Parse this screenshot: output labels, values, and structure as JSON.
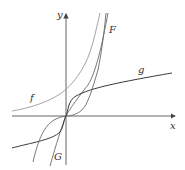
{
  "diagram": {
    "axes": {
      "x_label": "x",
      "y_label": "y"
    },
    "curves": [
      {
        "name": "f",
        "label": "f",
        "color": "#9a9a9a",
        "description": "exponential-like, positive everywhere"
      },
      {
        "name": "F",
        "label": "F",
        "color": "#6a6a6a",
        "description": "antiderivative of f through origin"
      },
      {
        "name": "g",
        "label": "g",
        "color": "#3a3a3a",
        "description": "cube-root-like, through origin"
      },
      {
        "name": "G",
        "label": "G",
        "color": "#6a6a6a",
        "description": "cubic-like, through origin"
      }
    ],
    "colors": {
      "axis": "#555555",
      "background": "#ffffff"
    }
  }
}
